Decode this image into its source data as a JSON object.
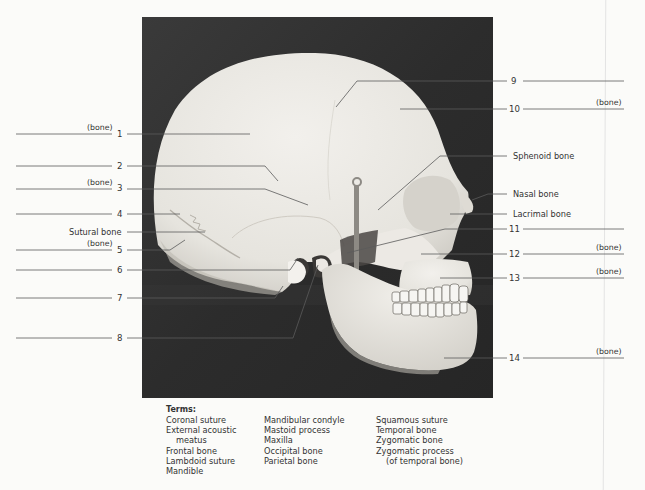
{
  "figure": {
    "photo_background": "#2f2f2f",
    "bone_color": "#e9e7e2",
    "line_color": "#4a4a4a"
  },
  "left_labels": [
    {
      "num": "1",
      "suffix": "(bone)",
      "y": 134
    },
    {
      "num": "2",
      "suffix": "",
      "y": 166
    },
    {
      "num": "3",
      "suffix": "(bone)",
      "y": 189
    },
    {
      "num": "4",
      "suffix": "",
      "y": 214
    },
    {
      "num": "5",
      "suffix": "(bone)",
      "y": 250
    },
    {
      "num": "6",
      "suffix": "",
      "y": 270
    },
    {
      "num": "7",
      "suffix": "",
      "y": 298
    },
    {
      "num": "8",
      "suffix": "",
      "y": 338
    }
  ],
  "left_named": [
    {
      "text": "Sutural bone",
      "y": 232
    }
  ],
  "right_labels": [
    {
      "num": "9",
      "suffix": "",
      "y": 81
    },
    {
      "num": "10",
      "suffix": "(bone)",
      "y": 109
    },
    {
      "num": "11",
      "suffix": "",
      "y": 229
    },
    {
      "num": "12",
      "suffix": "(bone)",
      "y": 254
    },
    {
      "num": "13",
      "suffix": "(bone)",
      "y": 278
    },
    {
      "num": "14",
      "suffix": "(bone)",
      "y": 358
    }
  ],
  "right_named": [
    {
      "text": "Sphenoid bone",
      "y": 156
    },
    {
      "text": "Nasal bone",
      "y": 194
    },
    {
      "text": "Lacrimal bone",
      "y": 214
    }
  ],
  "terms": {
    "heading": "Terms:",
    "columns": [
      [
        "Coronal suture",
        "External acoustic",
        "   meatus",
        "Frontal bone",
        "Lambdoid suture",
        "Mandible"
      ],
      [
        "Mandibular condyle",
        "Mastoid process",
        "Maxilla",
        "Occipital bone",
        "Parietal bone"
      ],
      [
        "Squamous suture",
        "Temporal bone",
        "Zygomatic bone",
        "Zygomatic process",
        "   (of temporal bone)"
      ]
    ]
  }
}
